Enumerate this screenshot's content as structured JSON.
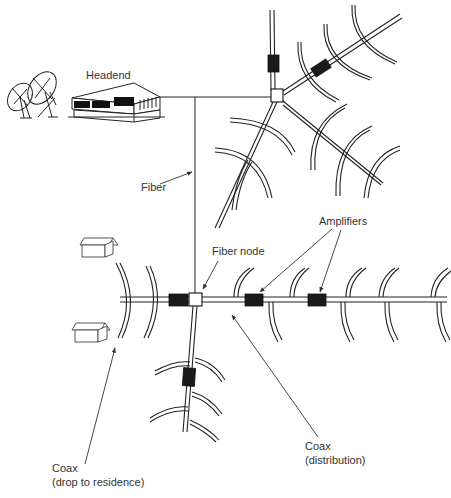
{
  "labels": {
    "headend": "Headend",
    "fiber": "Fiber",
    "fiber_node": "Fiber node",
    "amplifiers": "Amplifiers",
    "coax_distribution_line1": "Coax",
    "coax_distribution_line2": "(distribution)",
    "coax_drop_line1": "Coax",
    "coax_drop_line2": "(drop to residence)"
  },
  "components": {
    "satellite_dishes": 2,
    "headend_building": 1,
    "fiber_nodes": 2,
    "amplifiers_visible": 6,
    "residences": 2
  },
  "colors": {
    "line": "#222222",
    "amplifier_fill": "#1a1a1a",
    "label_text": "#333333",
    "background": "#ffffff"
  }
}
